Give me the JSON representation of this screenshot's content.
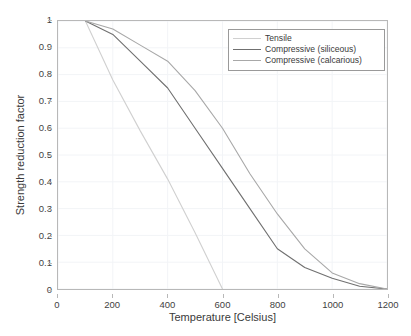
{
  "chart_data": {
    "type": "line",
    "title": "",
    "xlabel": "Temperature [Celsius]",
    "ylabel": "Strength reduction factor",
    "xlim": [
      0,
      1200
    ],
    "ylim": [
      0,
      1
    ],
    "xticks": [
      0,
      200,
      400,
      600,
      800,
      1000,
      1200
    ],
    "yticks": [
      0,
      0.1,
      0.2,
      0.3,
      0.4,
      0.5,
      0.6,
      0.7,
      0.8,
      0.9,
      1
    ],
    "xtick_labels": [
      "0",
      "200",
      "400",
      "600",
      "800",
      "1000",
      "1200"
    ],
    "ytick_labels": [
      "0",
      "0.1",
      "0.2",
      "0.3",
      "0.4",
      "0.5",
      "0.6",
      "0.7",
      "0.8",
      "0.9",
      "1"
    ],
    "grid": true,
    "legend_position": "top-right",
    "series": [
      {
        "name": "Tensile",
        "color": "#d0d0d0",
        "x": [
          100,
          200,
          300,
          400,
          500,
          600
        ],
        "y": [
          1.0,
          0.78,
          0.59,
          0.41,
          0.21,
          0.0
        ]
      },
      {
        "name": "Compressive (siliceous)",
        "color": "#707070",
        "x": [
          100,
          200,
          300,
          400,
          500,
          600,
          700,
          800,
          900,
          1000,
          1100,
          1200
        ],
        "y": [
          1.0,
          0.95,
          0.85,
          0.75,
          0.6,
          0.45,
          0.3,
          0.15,
          0.08,
          0.04,
          0.01,
          0.0
        ]
      },
      {
        "name": "Compressive (calcarious)",
        "color": "#a8a8a8",
        "x": [
          100,
          200,
          300,
          400,
          500,
          600,
          700,
          800,
          900,
          1000,
          1100,
          1200
        ],
        "y": [
          1.0,
          0.97,
          0.91,
          0.85,
          0.74,
          0.6,
          0.43,
          0.28,
          0.15,
          0.06,
          0.02,
          0.0
        ]
      }
    ]
  },
  "axes": {
    "x_label": "Temperature [Celsius]",
    "y_label": "Strength reduction factor"
  },
  "legend": {
    "entries": [
      {
        "label": "Tensile"
      },
      {
        "label": "Compressive (siliceous)"
      },
      {
        "label": "Compressive (calcarious)"
      }
    ]
  },
  "colors": {
    "plot_border": "#b8b8b8",
    "grid": "#f2f4f7",
    "text": "#3a3a3a",
    "background": "#ffffff",
    "tensile": "#d0d0d0",
    "siliceous": "#707070",
    "calcarious": "#a8a8a8"
  }
}
